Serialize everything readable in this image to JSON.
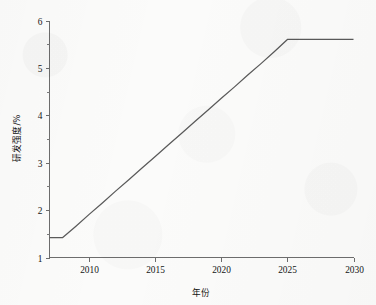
{
  "chart_data": {
    "type": "line",
    "title": "",
    "subtitle": "",
    "xlabel": "年份",
    "ylabel": "研发强度/%",
    "xlim": [
      2007,
      2030
    ],
    "ylim": [
      1,
      6
    ],
    "grid": false,
    "legend": false,
    "legend_position": "none",
    "line_color": "#5a5a5a",
    "axis_color": "#6d6d6d",
    "background_color": "#fbfbfa",
    "x_ticks": [
      {
        "value": 2010,
        "label": "2010"
      },
      {
        "value": 2015,
        "label": "2015"
      },
      {
        "value": 2020,
        "label": "2020"
      },
      {
        "value": 2025,
        "label": "2025"
      },
      {
        "value": 2030,
        "label": "2030"
      }
    ],
    "y_ticks": [
      {
        "value": 1,
        "label": "1"
      },
      {
        "value": 2,
        "label": "2"
      },
      {
        "value": 3,
        "label": "3"
      },
      {
        "value": 4,
        "label": "4"
      },
      {
        "value": 5,
        "label": "5"
      },
      {
        "value": 6,
        "label": "6"
      }
    ],
    "y_minor_ticks": [
      1.5,
      2.5,
      3.5,
      4.5,
      5.5
    ],
    "series": [
      {
        "name": "研发强度",
        "x": [
          2007,
          2008,
          2009,
          2010,
          2011,
          2012,
          2013,
          2014,
          2015,
          2016,
          2017,
          2018,
          2019,
          2020,
          2021,
          2022,
          2023,
          2024,
          2025,
          2026,
          2027,
          2028,
          2029,
          2030
        ],
        "values": [
          1.42,
          1.42,
          1.66,
          1.91,
          2.15,
          2.4,
          2.64,
          2.89,
          3.13,
          3.38,
          3.62,
          3.87,
          4.11,
          4.36,
          4.6,
          4.85,
          5.09,
          5.34,
          5.6,
          5.6,
          5.6,
          5.6,
          5.6,
          5.6
        ]
      }
    ],
    "annotations": [
      {
        "text": "flat segment 2007-2008 at 1.42"
      },
      {
        "text": "linear rise 2008-2025 from 1.42 to 5.60"
      },
      {
        "text": "plateau 2025-2030 at 5.60"
      }
    ]
  },
  "axis_titles": {
    "x": "年份",
    "y": "研发强度/%"
  }
}
